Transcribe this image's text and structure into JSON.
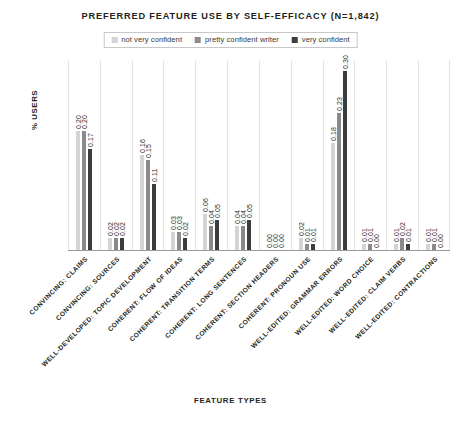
{
  "chart_data": {
    "type": "bar",
    "title": "PREFERRED FEATURE USE BY SELF-EFFICACY (N=1,842)",
    "xlabel": "FEATURE TYPES",
    "ylabel": "% USERS",
    "ylim": [
      0,
      0.32
    ],
    "grid": "vertical-only",
    "legend_position": "top-center",
    "categories": [
      "CONVINCING: CLAIMS",
      "CONVINCING: SOURCES",
      "WELL-DEVELOPED: TOPIC DEVELOPMENT",
      "COHERENT: FLOW OF IDEAS",
      "COHERENT: TRANSITION TERMS",
      "COHERENT: LONG SENTENCES",
      "COHERENT: SECTION HEADERS",
      "COHERENT: PRONOUN USE",
      "WELL-EDITED: GRAMMAR ERRORS",
      "WELL-EDITED: WORD CHOICE",
      "WELL-EDITED: CLAIM VERBS",
      "WELL-EDITED: CONTRACTIONS"
    ],
    "series": [
      {
        "name": "not very confident",
        "color": "#d4d4d4",
        "values": [
          0.2,
          0.02,
          0.16,
          0.03,
          0.06,
          0.04,
          0.0,
          0.02,
          0.18,
          0.01,
          0.01,
          0.01
        ],
        "labels": [
          "0.20",
          "0.02",
          "0.16",
          "0.03",
          "0.06",
          "0.04",
          "0.00",
          "0.02",
          "0.18",
          "0.01",
          "0.01",
          "0.01"
        ]
      },
      {
        "name": "pretty confident writer",
        "color": "#8a8a8a",
        "values": [
          0.2,
          0.02,
          0.15,
          0.03,
          0.04,
          0.04,
          0.0,
          0.01,
          0.23,
          0.01,
          0.02,
          0.01
        ],
        "labels": [
          "0.20",
          "0.02",
          "0.15",
          "0.03",
          "0.04",
          "0.04",
          "0.00",
          "0.01",
          "0.23",
          "0.01",
          "0.02",
          "0.01"
        ]
      },
      {
        "name": "very confident",
        "color": "#3d3d3d",
        "values": [
          0.17,
          0.02,
          0.11,
          0.02,
          0.05,
          0.05,
          0.0,
          0.01,
          0.3,
          0.0,
          0.01,
          0.0
        ],
        "labels": [
          "0.17",
          "0.02",
          "0.11",
          "0.02",
          "0.05",
          "0.05",
          "0.00",
          "0.01",
          "0.30",
          "0.00",
          "0.01",
          "0.00"
        ]
      }
    ]
  }
}
